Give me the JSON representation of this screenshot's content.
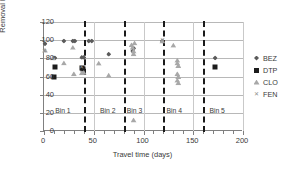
{
  "chart_data": {
    "type": "scatter",
    "title": "",
    "xlabel": "Travel time (days)",
    "ylabel": "Removal Efficiency (%)",
    "xlim": [
      0,
      200
    ],
    "ylim": [
      0,
      120
    ],
    "xticks": [
      0,
      50,
      100,
      150,
      200
    ],
    "yticks": [
      0,
      20,
      40,
      60,
      80,
      100,
      120
    ],
    "grid": "horizontal-and-vertical",
    "legend_position": "right",
    "bin_dividers": [
      40,
      80,
      120,
      160
    ],
    "bin_labels": [
      {
        "text": "Bin 1",
        "x": 20,
        "y": 22
      },
      {
        "text": "Bin 2",
        "x": 65,
        "y": 22
      },
      {
        "text": "Bin 3",
        "x": 92,
        "y": 22
      },
      {
        "text": "Bin 4",
        "x": 132,
        "y": 22
      },
      {
        "text": "Bin 5",
        "x": 175,
        "y": 22
      }
    ],
    "series": [
      {
        "name": "BEZ",
        "marker": "diamond",
        "color": "#5b5b5b",
        "points": [
          {
            "x": 1,
            "y": 96
          },
          {
            "x": 10,
            "y": 80.5
          },
          {
            "x": 11,
            "y": 80.5
          },
          {
            "x": 20,
            "y": 99
          },
          {
            "x": 29,
            "y": 99
          },
          {
            "x": 31,
            "y": 99
          },
          {
            "x": 38,
            "y": 81
          },
          {
            "x": 40,
            "y": 81
          },
          {
            "x": 45,
            "y": 99
          },
          {
            "x": 48,
            "y": 99
          },
          {
            "x": 65,
            "y": 84.5
          },
          {
            "x": 89,
            "y": 88
          },
          {
            "x": 90,
            "y": 91
          },
          {
            "x": 119,
            "y": 99
          },
          {
            "x": 172,
            "y": 80.5
          }
        ]
      },
      {
        "name": "DTP",
        "marker": "square",
        "color": "#1c1c1c",
        "points": [
          {
            "x": 10,
            "y": 59.5
          },
          {
            "x": 11,
            "y": 71
          },
          {
            "x": 38,
            "y": 69
          },
          {
            "x": 39,
            "y": 68
          },
          {
            "x": 172,
            "y": 70.5
          }
        ]
      },
      {
        "name": "CLO",
        "marker": "triangle",
        "color": "#a8a8a8",
        "points": [
          {
            "x": 1,
            "y": 89
          },
          {
            "x": 9,
            "y": 80.5
          },
          {
            "x": 20,
            "y": 75
          },
          {
            "x": 29,
            "y": 92
          },
          {
            "x": 30,
            "y": 63
          },
          {
            "x": 38,
            "y": 64
          },
          {
            "x": 40,
            "y": 64.5
          },
          {
            "x": 55,
            "y": 74.5
          },
          {
            "x": 65,
            "y": 61.5
          },
          {
            "x": 88,
            "y": 95
          },
          {
            "x": 89,
            "y": 92
          },
          {
            "x": 90,
            "y": 88
          },
          {
            "x": 90,
            "y": 85
          },
          {
            "x": 91,
            "y": 97
          },
          {
            "x": 90,
            "y": 12
          },
          {
            "x": 119,
            "y": 99
          },
          {
            "x": 130,
            "y": 94.5
          },
          {
            "x": 134,
            "y": 78
          },
          {
            "x": 134,
            "y": 75
          },
          {
            "x": 135,
            "y": 72
          },
          {
            "x": 134,
            "y": 63
          },
          {
            "x": 135,
            "y": 60
          },
          {
            "x": 134,
            "y": 56
          },
          {
            "x": 135,
            "y": 53
          }
        ]
      },
      {
        "name": "FEN",
        "marker": "x",
        "color": "#8e8e8e",
        "glyph": "✕",
        "points": [
          {
            "x": 1,
            "y": 88
          },
          {
            "x": 38,
            "y": 70
          },
          {
            "x": 119,
            "y": 100
          }
        ]
      }
    ]
  },
  "legend": {
    "entries": [
      {
        "label": "BEZ",
        "symbol": "diamond"
      },
      {
        "label": "DTP",
        "symbol": "square"
      },
      {
        "label": "CLO",
        "symbol": "triangle"
      },
      {
        "label": "FEN",
        "symbol": "x"
      }
    ]
  }
}
